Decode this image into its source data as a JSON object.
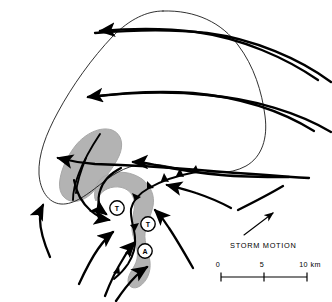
{
  "figure": {
    "name": "supercell-thunderstorm-schematic",
    "background_color": "#ffffff",
    "ink_color": "#000000",
    "echo_fill_color": "#b3b3b3",
    "echo_edge_color": "#9a9a9a",
    "width": 332,
    "height": 302
  },
  "legend": {
    "storm_motion_label": "STORM MOTION",
    "storm_motion_arrow": "storm-motion-arrow-icon"
  },
  "scale_bar": {
    "ticks": [
      {
        "label": "0",
        "x": 0
      },
      {
        "label": "5",
        "x": 5
      },
      {
        "label": "10 km",
        "x": 10
      }
    ],
    "units": "km",
    "min": 0,
    "max": 10
  },
  "vortex_markers": [
    {
      "id": "vortex-1",
      "label": "T",
      "meaning": "tornado",
      "cx": 117,
      "cy": 208
    },
    {
      "id": "vortex-2",
      "label": "T",
      "meaning": "tornado",
      "cx": 148,
      "cy": 224
    },
    {
      "id": "vortex-3",
      "label": "A",
      "meaning": "anticyclonic-vortex",
      "cx": 145,
      "cy": 251
    }
  ],
  "features": {
    "anvil_outline": "storm-anvil-outline",
    "precip_echo_main": "precipitation-echo-region",
    "precip_echo_hook": "hook-echo-region",
    "gust_front": "gust-front-line",
    "gust_front_barbs": 7,
    "upper_level_flow_arrows": 4,
    "inflow_arrows_right": 3,
    "inflow_arrows_left": 5,
    "echo_core_streamlines": 2
  }
}
